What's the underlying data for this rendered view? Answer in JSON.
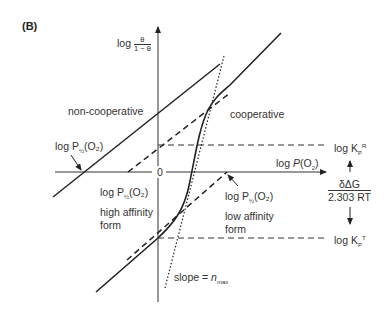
{
  "panel_label": "(B)",
  "y_axis": {
    "label_log": "log",
    "frac_num": "θ",
    "frac_den": "1 − θ"
  },
  "x_axis": {
    "label": "log P(O",
    "sub": "2",
    "close": ")"
  },
  "origin": "0",
  "labels": {
    "non_cooperative": "non-cooperative",
    "cooperative": "cooperative",
    "half_sat_left": {
      "pre": "log P",
      "sub": "½",
      "post": "(O₂)"
    },
    "half_sat_high": {
      "pre": "log P",
      "sub": "½",
      "post": "(O₂)"
    },
    "half_sat_low": {
      "pre": "log P",
      "sub": "½",
      "post": "(O₂)"
    },
    "high_affinity": "high affinity",
    "high_affinity_form": "form",
    "low_affinity": "low affinity",
    "low_affinity_form": "form",
    "slope": "slope = ",
    "slope_n": "n",
    "slope_sub": "max",
    "kr": {
      "pre": "log K",
      "sub": "P",
      "sup": "R"
    },
    "kt": {
      "pre": "log K",
      "sub": "P",
      "sup": "T"
    },
    "energy_num": "δΔG",
    "energy_den": "2.303 RT"
  }
}
